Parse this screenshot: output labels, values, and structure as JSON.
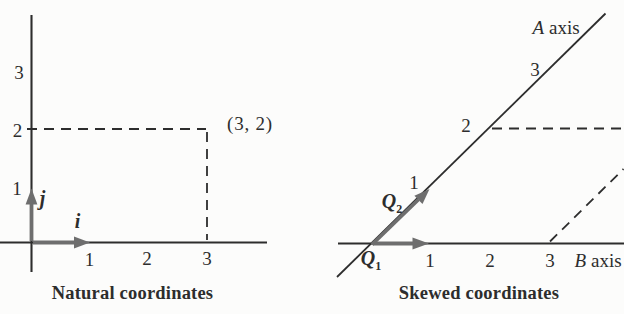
{
  "colors": {
    "ink": "#2d2d2d",
    "vector": "#6e6e6e",
    "paper": "#fcfcfb"
  },
  "left_panel": {
    "caption": "Natural coordinates",
    "x_tick_labels": [
      "1",
      "2",
      "3"
    ],
    "y_tick_labels": [
      "1",
      "2",
      "3"
    ],
    "point_label": "(3, 2)",
    "point_coordinates": {
      "x": 3,
      "y": 2
    },
    "i_vector_label": "i",
    "j_vector_label": "j"
  },
  "right_panel": {
    "caption": "Skewed coordinates",
    "a_axis": {
      "letter": "A",
      "word": "axis"
    },
    "b_axis": {
      "letter": "B",
      "word": "axis"
    },
    "a_tick_labels": [
      "1",
      "2",
      "3"
    ],
    "b_tick_labels": [
      "1",
      "2",
      "3"
    ],
    "q1": {
      "letter": "Q",
      "subscript": "1"
    },
    "q2": {
      "letter": "Q",
      "subscript": "2"
    }
  }
}
